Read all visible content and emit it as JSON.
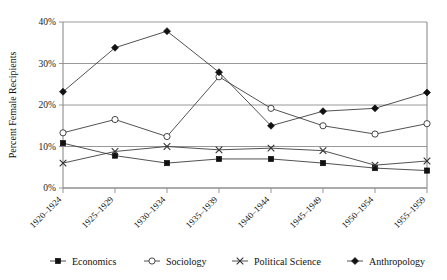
{
  "chart_data": {
    "type": "line",
    "title": "",
    "xlabel": "",
    "ylabel": "Percent Female Recipients",
    "ylim": [
      0,
      40
    ],
    "yticks": [
      0,
      10,
      20,
      30,
      40
    ],
    "ytick_labels": [
      "0%",
      "10%",
      "20%",
      "30%",
      "40%"
    ],
    "grid": true,
    "legend_position": "bottom",
    "categories": [
      "1920–1924",
      "1925–1929",
      "1930–1934",
      "1935–1939",
      "1940–1944",
      "1945–1949",
      "1950–1954",
      "1955–1959"
    ],
    "series": [
      {
        "name": "Economics",
        "marker": "filled-square",
        "values": [
          10.8,
          7.8,
          6.0,
          7.0,
          7.0,
          6.0,
          4.8,
          4.2
        ]
      },
      {
        "name": "Sociology",
        "marker": "open-circle",
        "values": [
          13.3,
          16.5,
          12.4,
          26.8,
          19.2,
          15.0,
          13.0,
          15.5
        ]
      },
      {
        "name": "Political Science",
        "marker": "cross",
        "values": [
          6.0,
          8.8,
          10.0,
          9.2,
          9.6,
          9.0,
          5.5,
          6.5
        ]
      },
      {
        "name": "Anthropology",
        "marker": "filled-diamond",
        "values": [
          23.2,
          33.8,
          37.8,
          27.9,
          15.0,
          18.5,
          19.2,
          23.0
        ]
      }
    ]
  },
  "legend": {
    "items": [
      {
        "label": "Economics",
        "marker": "filled-square"
      },
      {
        "label": "Sociology",
        "marker": "open-circle"
      },
      {
        "label": "Political Science",
        "marker": "cross"
      },
      {
        "label": "Anthropology",
        "marker": "filled-diamond"
      }
    ]
  },
  "colors": {
    "line": "#333333",
    "grid": "#8c8c8c",
    "text": "#111111",
    "background": "#ffffff"
  }
}
